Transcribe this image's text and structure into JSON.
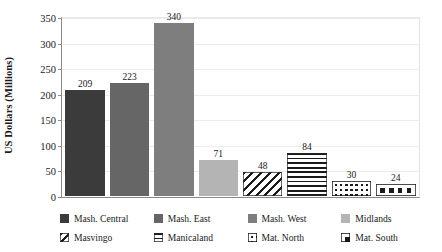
{
  "chart_data": {
    "type": "bar",
    "title": "",
    "xlabel": "",
    "ylabel": "US Dollars (Millions)",
    "ylim": [
      0,
      350
    ],
    "ytick_labels": [
      "350",
      "300",
      "250",
      "200",
      "150",
      "100",
      "50",
      "0"
    ],
    "yticks": [
      350,
      300,
      250,
      200,
      150,
      100,
      50,
      0
    ],
    "grid": true,
    "legend_position": "bottom",
    "categories": [
      "Mash. Central",
      "Mash. East",
      "Mash. West",
      "Midlands",
      "Masvingo",
      "Manicaland",
      "Mat. North",
      "Mat. South"
    ],
    "values": [
      209,
      223,
      340,
      71,
      48,
      84,
      30,
      24
    ],
    "data_labels": [
      "209",
      "223",
      "340",
      "71",
      "48",
      "84",
      "30",
      "24"
    ],
    "bars": [
      {
        "label": "Mash. Central",
        "value": 209,
        "data_label": "209",
        "fill": "solid",
        "color": "#3b3b3b"
      },
      {
        "label": "Mash. East",
        "value": 223,
        "data_label": "223",
        "fill": "solid",
        "color": "#666666"
      },
      {
        "label": "Mash. West",
        "value": 340,
        "data_label": "340",
        "fill": "solid",
        "color": "#7e7e7e"
      },
      {
        "label": "Midlands",
        "value": 71,
        "data_label": "71",
        "fill": "solid",
        "color": "#b4b4b4"
      },
      {
        "label": "Masvingo",
        "value": 48,
        "data_label": "48",
        "fill": "diagonal-hatch",
        "color": "#1a1a1a"
      },
      {
        "label": "Manicaland",
        "value": 84,
        "data_label": "84",
        "fill": "horizontal-stripe",
        "color": "#1a1a1a"
      },
      {
        "label": "Mat. North",
        "value": 30,
        "data_label": "30",
        "fill": "fine-checker",
        "color": "#1a1a1a"
      },
      {
        "label": "Mat. South",
        "value": 24,
        "data_label": "24",
        "fill": "bold-checker",
        "color": "#1a1a1a"
      }
    ]
  },
  "legend": {
    "items": [
      {
        "label": "Mash. Central",
        "fill": "solid",
        "color": "#3b3b3b"
      },
      {
        "label": "Mash. East",
        "fill": "solid",
        "color": "#666666"
      },
      {
        "label": "Mash. West",
        "fill": "solid",
        "color": "#7e7e7e"
      },
      {
        "label": "Midlands",
        "fill": "solid",
        "color": "#b4b4b4"
      },
      {
        "label": "Masvingo",
        "fill": "diagonal-hatch",
        "color": "#1a1a1a"
      },
      {
        "label": "Manicaland",
        "fill": "horizontal-stripe",
        "color": "#1a1a1a"
      },
      {
        "label": "Mat. North",
        "fill": "fine-checker",
        "color": "#1a1a1a"
      },
      {
        "label": "Mat. South",
        "fill": "bold-checker",
        "color": "#1a1a1a"
      }
    ]
  },
  "colors": {
    "axis": "#8a8a8a",
    "grid": "#ececec",
    "text": "#1a1a1a",
    "background": "#ffffff"
  }
}
